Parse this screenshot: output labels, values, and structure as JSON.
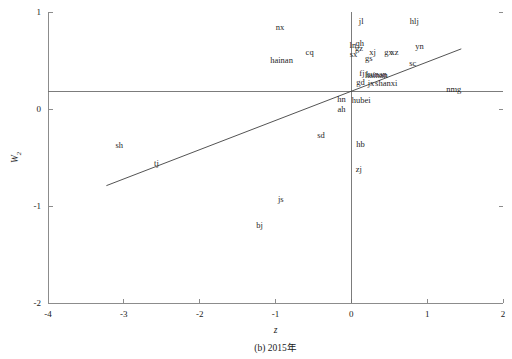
{
  "chart_data": {
    "type": "scatter",
    "title": "",
    "caption": "(b) 2015年",
    "xlabel": "z",
    "ylabel": "W",
    "ylabel_sub": "2",
    "xlim": [
      -4,
      2
    ],
    "ylim": [
      -2,
      1
    ],
    "xticks": [
      "-4",
      "-3",
      "-2",
      "-1",
      "0",
      "1",
      "2"
    ],
    "xtick_values": [
      -4,
      -3,
      -2,
      -1,
      0,
      1,
      2
    ],
    "yticks": [
      "1",
      "0",
      "-1",
      "-2"
    ],
    "ytick_values": [
      1,
      0,
      -1,
      -2
    ],
    "grid": false,
    "legend": "none",
    "reference_lines": [
      {
        "name": "horizontal-mean-line",
        "orientation": "horizontal",
        "value": 0.18
      },
      {
        "name": "vertical-zero-line",
        "orientation": "vertical",
        "value": 0.0
      }
    ],
    "trend_line": {
      "name": "regression-line",
      "x_start": -3.23,
      "y_start": -0.79,
      "x_end": 1.45,
      "y_end": 0.62
    },
    "points": [
      {
        "label": "nx",
        "x": -0.94,
        "y": 0.845
      },
      {
        "label": "jl",
        "x": 0.13,
        "y": 0.905
      },
      {
        "label": "hlj",
        "x": 0.83,
        "y": 0.905
      },
      {
        "label": "qh",
        "x": 0.11,
        "y": 0.68
      },
      {
        "label": "ln",
        "x": 0.02,
        "y": 0.655
      },
      {
        "label": "gz",
        "x": 0.1,
        "y": 0.625
      },
      {
        "label": "yn",
        "x": 0.9,
        "y": 0.645
      },
      {
        "label": "cq",
        "x": -0.55,
        "y": 0.585
      },
      {
        "label": "sx",
        "x": 0.03,
        "y": 0.565
      },
      {
        "label": "xj",
        "x": 0.28,
        "y": 0.585
      },
      {
        "label": "gx",
        "x": 0.49,
        "y": 0.585
      },
      {
        "label": "xz",
        "x": 0.57,
        "y": 0.585
      },
      {
        "label": "gs",
        "x": 0.23,
        "y": 0.525
      },
      {
        "label": "hainan",
        "x": -0.92,
        "y": 0.51
      },
      {
        "label": "sc",
        "x": 0.81,
        "y": 0.475
      },
      {
        "label": "fj",
        "x": 0.14,
        "y": 0.37
      },
      {
        "label": "hunan",
        "x": 0.33,
        "y": 0.365
      },
      {
        "label": "hainan2",
        "x": 0.33,
        "y": 0.355
      },
      {
        "label": "gd",
        "x": 0.12,
        "y": 0.275
      },
      {
        "label": "jx",
        "x": 0.26,
        "y": 0.265
      },
      {
        "label": "shanxi",
        "x": 0.46,
        "y": 0.265
      },
      {
        "label": "nmg",
        "x": 1.35,
        "y": 0.205
      },
      {
        "label": "hn",
        "x": -0.13,
        "y": 0.105
      },
      {
        "label": "hubei",
        "x": 0.13,
        "y": 0.095
      },
      {
        "label": "ah",
        "x": -0.13,
        "y": 0.0
      },
      {
        "label": "sd",
        "x": -0.4,
        "y": -0.27
      },
      {
        "label": "hb",
        "x": 0.12,
        "y": -0.36
      },
      {
        "label": "sh",
        "x": -3.06,
        "y": -0.37
      },
      {
        "label": "tj",
        "x": -2.57,
        "y": -0.56
      },
      {
        "label": "zj",
        "x": 0.1,
        "y": -0.62
      },
      {
        "label": "js",
        "x": -0.93,
        "y": -0.93
      },
      {
        "label": "bj",
        "x": -1.21,
        "y": -1.2
      }
    ]
  }
}
